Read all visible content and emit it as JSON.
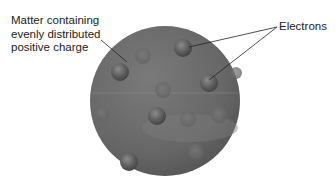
{
  "diagram": {
    "labels": {
      "matter": [
        "Matter containing",
        "evenly distributed",
        "positive charge"
      ],
      "electrons": "Electrons"
    },
    "colors": {
      "sphere": "#6e6e6e",
      "sphere_highlight": "#8a8a8a",
      "electron": "#5c5c5c",
      "leader_line": "#222222"
    },
    "electron_count": 12
  }
}
